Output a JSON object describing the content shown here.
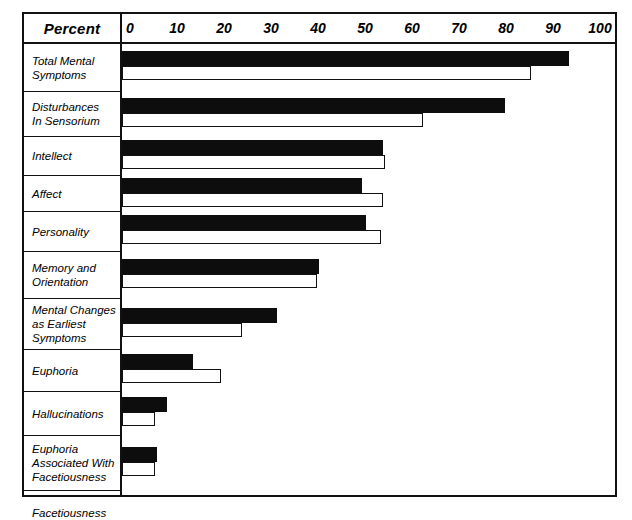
{
  "chart_data": {
    "type": "bar",
    "orientation": "horizontal",
    "title": "",
    "xlabel": "Percent",
    "ylabel": "",
    "xlim": [
      0,
      100
    ],
    "xticks": [
      0,
      10,
      20,
      30,
      40,
      50,
      60,
      70,
      80,
      90,
      100
    ],
    "grid": false,
    "legend": "none",
    "categories": [
      "Total Mental Symptoms",
      "Disturbances In Sensorium",
      "Intellect",
      "Affect",
      "Personality",
      "Memory and Orientation",
      "Mental Changes as Earliest Symptoms",
      "Euphoria",
      "Hallucinations",
      "Euphoria Associated With Facetiousness",
      "Facetiousness"
    ],
    "series": [
      {
        "name": "solid",
        "style": "filled-black",
        "values": [
          95,
          81.5,
          55.5,
          51,
          52,
          42,
          33,
          15,
          9.5,
          7.5,
          7.5
        ]
      },
      {
        "name": "hollow",
        "style": "outlined-white",
        "values": [
          87,
          64,
          56,
          55.5,
          55,
          41.5,
          25.5,
          21,
          7,
          7,
          12
        ]
      }
    ]
  },
  "header": {
    "row_label_header": "Percent"
  },
  "rows": [
    {
      "lines": [
        "Total Mental",
        "Symptoms"
      ]
    },
    {
      "lines": [
        "Disturbances",
        "In Sensorium"
      ]
    },
    {
      "lines": [
        "Intellect"
      ]
    },
    {
      "lines": [
        "Affect"
      ]
    },
    {
      "lines": [
        "Personality"
      ]
    },
    {
      "lines": [
        "Memory and",
        "Orientation"
      ]
    },
    {
      "lines": [
        "Mental Changes",
        "as Earliest",
        "Symptoms"
      ]
    },
    {
      "lines": [
        "Euphoria"
      ]
    },
    {
      "lines": [
        "Hallucinations"
      ]
    },
    {
      "lines": [
        "Euphoria",
        "Associated With",
        "Facetiousness"
      ]
    },
    {
      "lines": [
        "Facetiousness"
      ]
    }
  ]
}
